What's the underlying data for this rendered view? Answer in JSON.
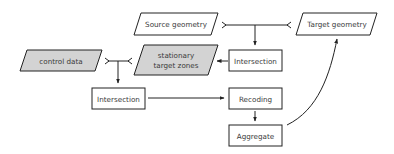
{
  "diagram": {
    "type": "flowchart",
    "colors": {
      "stroke": "#222222",
      "data_fill": "#ffffff",
      "highlight_fill": "#d3d3d3",
      "process_fill": "#ffffff",
      "text": "#3a3a3a"
    },
    "nodes": {
      "source_geometry": {
        "label": "Source geometry",
        "shape": "parallelogram",
        "fill": "white"
      },
      "target_geometry": {
        "label": "Target geometry",
        "shape": "parallelogram",
        "fill": "white"
      },
      "intersection_top": {
        "label": "Intersection",
        "shape": "rectangle"
      },
      "stationary_target_zones": {
        "label_line1": "stationary",
        "label_line2": "target zones",
        "shape": "parallelogram",
        "fill": "gray"
      },
      "control_data": {
        "label": "control data",
        "shape": "parallelogram",
        "fill": "gray"
      },
      "intersection_bottom": {
        "label": "Intersection",
        "shape": "rectangle"
      },
      "recoding": {
        "label": "Recoding",
        "shape": "rectangle"
      },
      "aggregate": {
        "label": "Aggregate",
        "shape": "rectangle"
      }
    },
    "edges": [
      {
        "from": [
          "Source geometry",
          "Target geometry"
        ],
        "to": "Intersection",
        "kind": "join"
      },
      {
        "from": "Intersection",
        "to": "stationary target zones"
      },
      {
        "from": [
          "control data",
          "stationary target zones"
        ],
        "to": "Intersection",
        "kind": "join"
      },
      {
        "from": "Intersection",
        "to": "Recoding"
      },
      {
        "from": "Recoding",
        "to": "Aggregate"
      },
      {
        "from": "Aggregate",
        "to": "Target geometry",
        "kind": "curve"
      }
    ]
  }
}
